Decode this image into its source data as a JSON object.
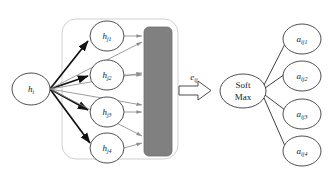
{
  "diagram": {
    "background_color": "#ffffff",
    "source_node": {
      "id": "h-i",
      "label_base": "h",
      "label_sub": "i",
      "cx": 31,
      "cy": 89,
      "rx": 19,
      "ry": 16
    },
    "neighbor_group": {
      "name": "neighbor-group",
      "x": 62,
      "y": 19,
      "width": 116,
      "height": 140,
      "rx": 14,
      "stroke_color": "#cfcfcf"
    },
    "neighbor_nodes": [
      {
        "id": "h-j1",
        "label_base": "h",
        "label_sub": "j1",
        "cx": 107,
        "cy": 36,
        "rx": 17,
        "ry": 15
      },
      {
        "id": "h-j2",
        "label_base": "h",
        "label_sub": "j2",
        "cx": 107,
        "cy": 75,
        "rx": 17,
        "ry": 15
      },
      {
        "id": "h-j3",
        "label_base": "h",
        "label_sub": "j3",
        "cx": 107,
        "cy": 112,
        "rx": 17,
        "ry": 15
      },
      {
        "id": "h-j4",
        "label_base": "h",
        "label_sub": "j4",
        "cx": 107,
        "cy": 148,
        "rx": 17,
        "ry": 15
      }
    ],
    "feature_block": {
      "name": "feature-block",
      "x": 144,
      "y": 27,
      "width": 28,
      "height": 129,
      "rx": 5,
      "fill_color": "#808080"
    },
    "score_arrow": {
      "name": "score-block-arrow",
      "label_base": "e",
      "label_sub": "ij",
      "label_x": 194,
      "label_y": 80,
      "shaft_x": 179,
      "shaft_y": 86,
      "shaft_w": 28,
      "shaft_h": 9,
      "head_w": 11,
      "head_h": 19
    },
    "softmax": {
      "id": "soft-max",
      "line1": "Soft",
      "line2": "Max",
      "cx": 243,
      "cy": 91,
      "rx": 23,
      "ry": 17
    },
    "attention_nodes": [
      {
        "id": "a-ij1",
        "label_base": "a",
        "label_sub": "ij1",
        "cx": 302,
        "cy": 39,
        "rx": 19,
        "ry": 15
      },
      {
        "id": "a-ij2",
        "label_base": "a",
        "label_sub": "ij2",
        "cx": 302,
        "cy": 76,
        "rx": 19,
        "ry": 15
      },
      {
        "id": "a-ij3",
        "label_base": "a",
        "label_sub": "ij3",
        "cx": 302,
        "cy": 114,
        "rx": 19,
        "ry": 15
      },
      {
        "id": "a-ij4",
        "label_base": "a",
        "label_sub": "ij4",
        "cx": 302,
        "cy": 151,
        "rx": 19,
        "ry": 15
      }
    ],
    "edge_colors": {
      "strong": "#111111",
      "weak": "#8d8d8d",
      "thin": "#2b2b2b"
    }
  }
}
